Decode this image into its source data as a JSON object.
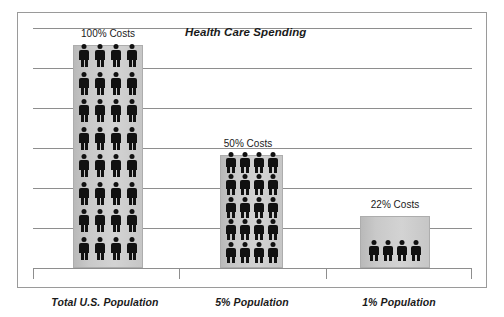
{
  "chart_data": {
    "type": "bar",
    "title": "Health Care Spending",
    "xlabel": "",
    "ylabel": "",
    "grid": true,
    "legend": "none",
    "gridline_count": 7,
    "axis_baseline_note": "horizontal axis with end ticks and category dividers",
    "categories": [
      "Total U.S. Population",
      "5% Population",
      "1% Population"
    ],
    "values": [
      100,
      50,
      22
    ],
    "value_unit": "percent of health care costs",
    "data_labels": [
      "100% Costs",
      "50% Costs",
      "22% Costs"
    ],
    "pictogram": {
      "glyph": "person",
      "figures_per_row": 4,
      "figure_counts": [
        32,
        20,
        4
      ],
      "row_counts": [
        8,
        5,
        1
      ],
      "note": "each bar is filled with person icons representing the share of population"
    },
    "ylim": [
      0,
      110
    ],
    "series": [
      {
        "name": "Share of Health Care Costs",
        "values": [
          100,
          50,
          22
        ]
      }
    ]
  },
  "colors": {
    "figure": "#111111",
    "bar_fill_light": "#d3d3d3",
    "bar_fill_dark": "#b9b9b9",
    "bar_border": "#adadad",
    "gridline": "#8e8e8e",
    "frame_border": "#9a9a9a",
    "text": "#1a1a1a",
    "background": "#ffffff"
  },
  "bars": [
    {
      "label": "100% Costs",
      "category": "Total U.S. Population",
      "rows": 8
    },
    {
      "label": "50% Costs",
      "category": "5% Population",
      "rows": 5
    },
    {
      "label": "22% Costs",
      "category": "1% Population",
      "rows": 1
    }
  ]
}
